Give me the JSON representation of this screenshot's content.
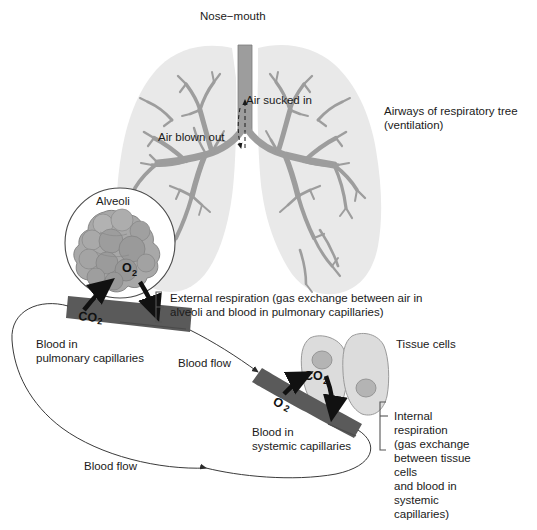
{
  "figure": {
    "background_color": "#ffffff",
    "palette": {
      "lung_fill": "#e9e9e9",
      "bronchi": "#9d9d9d",
      "bronchi_outline": "#7c7c7c",
      "alveoli_fill": "#a8a8a8",
      "alveoli_shade": "#8f8f8f",
      "blood_band": "#5a5a5a",
      "blood_band_dark": "#4a4a4a",
      "tissue_cell_fill": "#dcdcdc",
      "tissue_nucleus": "#b4b4b4",
      "outline": "#3a3a3a",
      "text": "#1a1a1a",
      "arrow_black": "#111111"
    }
  },
  "labels": {
    "nose_mouth": "Nose−mouth",
    "air_sucked_in": "Air sucked in",
    "air_blown_out": "Air blown out",
    "airways_line1": "Airways of respiratory tree",
    "airways_line2": "(ventilation)",
    "alveoli": "Alveoli",
    "o2_alveoli": "O",
    "o2_alveoli_sub": "2",
    "co2_pulmonary": "CO",
    "co2_pulmonary_sub": "2",
    "blood_in_pulmonary_line1": "Blood in",
    "blood_in_pulmonary_line2": "pulmonary capillaries",
    "external_respiration_line1": "External respiration (gas exchange between air in",
    "external_respiration_line2": "alveoli and blood in pulmonary capillaries)",
    "blood_flow_upper": "Blood flow",
    "blood_flow_lower": "Blood flow",
    "tissue_cells": "Tissue cells",
    "co2_tissue": "CO",
    "co2_tissue_sub": "2",
    "o2_systemic": "O",
    "o2_systemic_sub": "2",
    "blood_in_systemic_line1": "Blood in",
    "blood_in_systemic_line2": "systemic capillaries",
    "internal_respiration_lines": [
      "Internal",
      "respiration",
      "(gas exchange",
      "between tissue",
      "cells",
      "and blood in",
      "systemic",
      "capillaries)"
    ]
  },
  "annotations": {
    "brackets": [
      "external-respiration-bracket",
      "internal-respiration-bracket"
    ],
    "flow_arrows": [
      "air-in-arrow",
      "air-out-arrow",
      "co2-to-alveoli-arrow",
      "o2-from-alveoli-arrow",
      "co2-to-cell-arrow",
      "o2-to-cell-arrow",
      "blood-flow-arrow-upper",
      "blood-flow-arrow-lower"
    ]
  }
}
